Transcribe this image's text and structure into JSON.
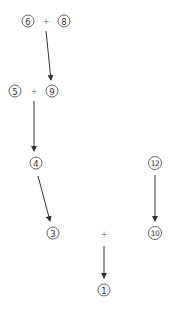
{
  "diagram": {
    "type": "expression-tree",
    "nodes": [
      {
        "id": "n6",
        "label": "6",
        "x": 28,
        "y": 21
      },
      {
        "id": "n8",
        "label": "8",
        "x": 64,
        "y": 21
      },
      {
        "id": "n5",
        "label": "5",
        "x": 15,
        "y": 91
      },
      {
        "id": "n9",
        "label": "9",
        "x": 52,
        "y": 91
      },
      {
        "id": "n4",
        "label": "4",
        "x": 36,
        "y": 163
      },
      {
        "id": "n12",
        "label": "12",
        "x": 155,
        "y": 163
      },
      {
        "id": "n3",
        "label": "3",
        "x": 53,
        "y": 233
      },
      {
        "id": "n10",
        "label": "10",
        "x": 155,
        "y": 233
      },
      {
        "id": "n1",
        "label": "1",
        "x": 104,
        "y": 290
      }
    ],
    "operators": [
      {
        "id": "op1",
        "label": "+",
        "x": 46,
        "y": 21
      },
      {
        "id": "op2",
        "label": "+",
        "x": 34,
        "y": 91
      },
      {
        "id": "op3",
        "label": "+",
        "x": 104,
        "y": 234
      }
    ],
    "edges": [
      {
        "from": "op1",
        "to": "n9",
        "x1": 46,
        "y1": 31,
        "x2": 51,
        "y2": 80
      },
      {
        "from": "op2",
        "to": "n4",
        "x1": 34,
        "y1": 101,
        "x2": 34,
        "y2": 151
      },
      {
        "from": "n4",
        "to": "n3",
        "x1": 38,
        "y1": 176,
        "x2": 50,
        "y2": 221
      },
      {
        "from": "n12",
        "to": "n10",
        "x1": 155,
        "y1": 175,
        "x2": 155,
        "y2": 221
      },
      {
        "from": "op3",
        "to": "n1",
        "x1": 104,
        "y1": 246,
        "x2": 104,
        "y2": 278
      }
    ],
    "colors": {
      "stroke": "#555555",
      "edge": "#333333",
      "text": "#333333",
      "operator": "#888888"
    }
  }
}
